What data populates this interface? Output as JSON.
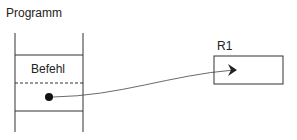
{
  "diagram": {
    "program_label": "Programm",
    "instruction_label": "Befehl",
    "register_label": "R1",
    "colors": {
      "stroke": "#333333",
      "text": "#222222",
      "background": "#ffffff"
    }
  }
}
